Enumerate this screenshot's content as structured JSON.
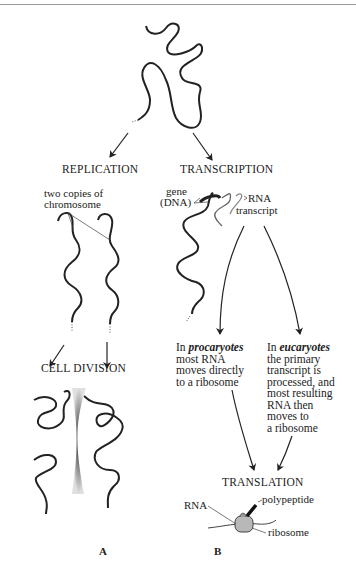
{
  "header": {
    "running_text": ""
  },
  "stages": {
    "replication": "REPLICATION",
    "transcription": "TRANSCRIPTION",
    "cell_division": "CELL DIVISION",
    "translation": "TRANSLATION"
  },
  "labels": {
    "two_copies_line1": "two copies of",
    "two_copies_line2": "chromosome",
    "gene_line1": "gene",
    "gene_line2": "(DNA)",
    "rna_transcript_line1": "RNA",
    "rna_transcript_line2": "transcript",
    "rna": "RNA",
    "polypeptide": "polypeptide",
    "ribosome": "ribosome"
  },
  "procaryotes": {
    "prefix": "In ",
    "emphasis": "procaryotes",
    "rest": "most RNA\nmoves directly\nto a ribosome"
  },
  "eucaryotes": {
    "prefix": "In ",
    "emphasis": "eucaryotes",
    "rest": "the primary\ntranscript is\nprocessed, and\nmost resulting\nRNA then\nmoves to\na ribosome"
  },
  "panels": {
    "a": "A",
    "b": "B"
  },
  "colors": {
    "ink": "#222222",
    "rule": "#9a9a9a",
    "ribosome_fill": "#b8b8b8"
  }
}
